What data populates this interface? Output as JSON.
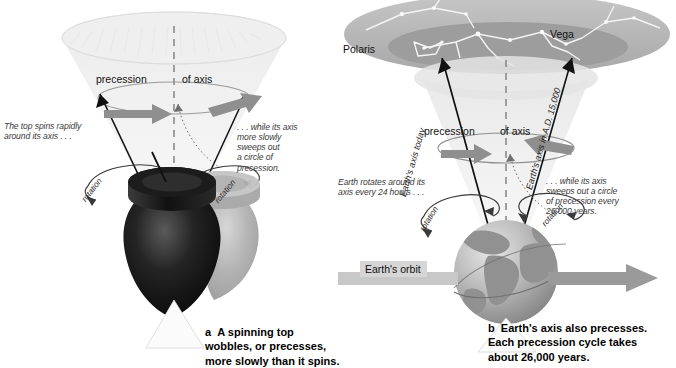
{
  "figure": {
    "colors": {
      "cone_light": "#f2f2f2",
      "cone_mid": "#e3e3e3",
      "cone_dark": "#cfcfcf",
      "arrow_gray": "#8c8c8c",
      "arrow_dark_gray": "#7a7a7a",
      "top_dark": "#1b1b1b",
      "top_ghost": "#b4b4b4",
      "earth_land": "#9a9a9a",
      "earth_ocean": "#c9c9c9",
      "sky_dome": "#b9b9b9",
      "sky_dome_inner": "#9f9f9f",
      "constellation_line": "#f4f4f4",
      "dashed_axis": "#8a8a8a",
      "text_body": "#3a3a3a",
      "text_caption": "#000000",
      "orbit_label_bg": "#d6d6d6"
    }
  },
  "panel_a": {
    "id": "a",
    "precession_label_left": "precession",
    "precession_label_right": "of axis",
    "rotation_label_left": "rotation",
    "rotation_label_right": "rotation",
    "note_left": "The top spins rapidly\naround its axis . . .",
    "note_right": ". . . while its axis\nmore slowly\nsweeps out\na circle of\nprecession.",
    "caption_letter": "a",
    "caption_text": "A spinning top\nwobbles, or precesses,\nmore slowly than it spins."
  },
  "panel_b": {
    "id": "b",
    "star_polaris": "Polaris",
    "star_vega": "Vega",
    "axis_today": "Earth's axis today",
    "axis_future": "Earth's axis in A.D. 15,000",
    "precession_label_left": "precession",
    "precession_label_right": "of axis",
    "rotation_label_left": "rotation",
    "rotation_label_right": "rotation",
    "note_left": "Earth rotates around its\naxis every 24 hours . . .",
    "note_right": ". . . while its axis\nsweeps out a circle\nof precession every\n26,000 years.",
    "orbit_label": "Earth's orbit",
    "caption_letter": "b",
    "caption_text": "Earth's axis also precesses.\nEach precession cycle takes\nabout 26,000 years."
  }
}
